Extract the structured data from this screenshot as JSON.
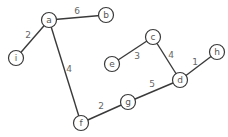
{
  "graph": {
    "colors": {
      "edge": "#3a3a3a",
      "node_stroke": "#3a3a3a",
      "node_fill": "#ffffff",
      "label": "#555555",
      "weight": "#666666"
    },
    "node_radius": 7.5,
    "nodes": [
      {
        "id": "a",
        "label": "a",
        "x": 49,
        "y": 20
      },
      {
        "id": "b",
        "label": "b",
        "x": 106,
        "y": 15
      },
      {
        "id": "i",
        "label": "i",
        "x": 16,
        "y": 58
      },
      {
        "id": "c",
        "label": "c",
        "x": 153,
        "y": 37
      },
      {
        "id": "e",
        "label": "e",
        "x": 112,
        "y": 64
      },
      {
        "id": "h",
        "label": "h",
        "x": 217,
        "y": 52
      },
      {
        "id": "d",
        "label": "d",
        "x": 180,
        "y": 80
      },
      {
        "id": "g",
        "label": "g",
        "x": 128,
        "y": 102
      },
      {
        "id": "f",
        "label": "f",
        "x": 81,
        "y": 123
      }
    ],
    "edges": [
      {
        "from": "a",
        "to": "b",
        "weight": "6",
        "lx": 77,
        "ly": 11
      },
      {
        "from": "a",
        "to": "i",
        "weight": "2",
        "lx": 28,
        "ly": 35
      },
      {
        "from": "a",
        "to": "f",
        "weight": "4",
        "lx": 69,
        "ly": 69
      },
      {
        "from": "c",
        "to": "e",
        "weight": "3",
        "lx": 137,
        "ly": 56
      },
      {
        "from": "c",
        "to": "d",
        "weight": "4",
        "lx": 171,
        "ly": 55
      },
      {
        "from": "d",
        "to": "h",
        "weight": "1",
        "lx": 195,
        "ly": 62
      },
      {
        "from": "g",
        "to": "d",
        "weight": "5",
        "lx": 152,
        "ly": 84
      },
      {
        "from": "f",
        "to": "g",
        "weight": "2",
        "lx": 101,
        "ly": 106
      }
    ]
  }
}
